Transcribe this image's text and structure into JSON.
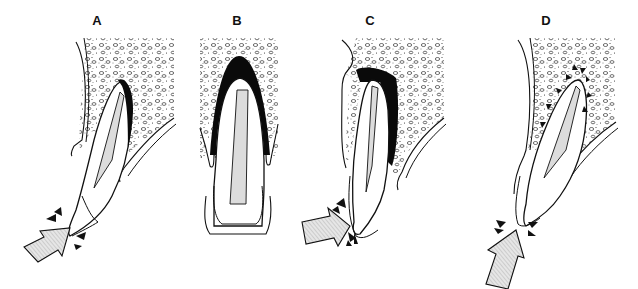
{
  "figure": {
    "panels": [
      {
        "id": "A",
        "label": "A",
        "label_x": 97,
        "content": "Tooth tilted with impact arrow at crown from lower-left; dark periodontal space compression at root apex",
        "impact": "crown-lateral"
      },
      {
        "id": "B",
        "label": "B",
        "label_x": 237,
        "content": "Upright tooth, no arrow; dark widened space surrounding root apex and sides (intrusion/extrusion view)",
        "impact": "none"
      },
      {
        "id": "C",
        "label": "C",
        "label_x": 370,
        "content": "Tooth tilted with impact arrow from left at cervical crown; large dark area on palatal side of root and apex",
        "impact": "crown-lateral-cervical"
      },
      {
        "id": "D",
        "label": "D",
        "label_x": 546,
        "content": "Tooth tilted with impact arrow from below at incisal edge; small arrowheads pointing toward root in bone",
        "impact": "axial-incisal"
      }
    ],
    "colors": {
      "line": "#111111",
      "background": "#ffffff",
      "pulp": "#dcdcdc",
      "arrow_fill": "#d8d8d8",
      "dark_space": "#0a0a0a"
    }
  }
}
